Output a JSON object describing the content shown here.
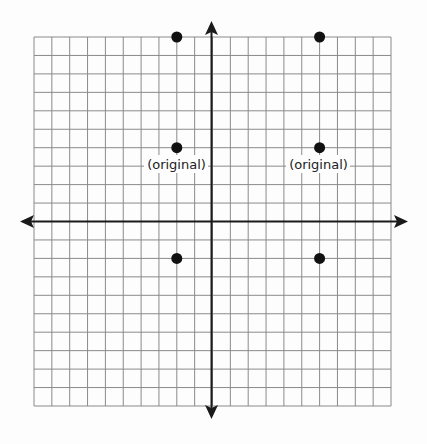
{
  "diagram": {
    "type": "coordinate-grid",
    "grid": {
      "columns": 20,
      "rows": 20,
      "x_range": [
        -10,
        10
      ],
      "y_range": [
        -10,
        10
      ]
    },
    "colors": {
      "grid": "#8a8a8a",
      "axis": "#1a1a1a",
      "point": "#111111",
      "label": "#222222",
      "background": "#fdfdfd"
    },
    "points": [
      {
        "x": -2,
        "y": 10,
        "label": ""
      },
      {
        "x": -2,
        "y": 4,
        "label": "(original)"
      },
      {
        "x": -2,
        "y": -2,
        "label": ""
      },
      {
        "x": 6,
        "y": 10,
        "label": ""
      },
      {
        "x": 6,
        "y": 4,
        "label": "(original)"
      },
      {
        "x": 6,
        "y": -2,
        "label": ""
      }
    ],
    "labels": {
      "left_original": "(original)",
      "right_original": "(original)"
    }
  }
}
